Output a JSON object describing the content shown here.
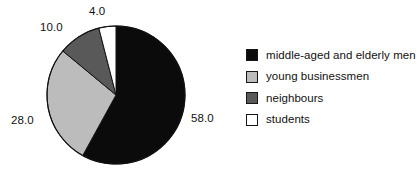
{
  "chart_data": {
    "type": "pie",
    "title": "",
    "categories": [
      "middle-aged and elderly men",
      "young businessmen",
      "neighbours",
      "students"
    ],
    "values": [
      58.0,
      28.0,
      10.0,
      4.0
    ],
    "value_labels": [
      "58.0",
      "28.0",
      "10.0",
      "4.0"
    ],
    "colors": [
      "#0b0b0b",
      "#bcbcbc",
      "#595959",
      "#ffffff"
    ],
    "total": 100.0,
    "start_angle_deg": 0,
    "direction": "clockwise",
    "legend_position": "right",
    "grid": false,
    "xlabel": "",
    "ylabel": ""
  },
  "legend": {
    "items": [
      {
        "label": "middle-aged and elderly men",
        "color": "#0b0b0b",
        "value": "58.0"
      },
      {
        "label": "young businessmen",
        "color": "#bcbcbc",
        "value": "28.0"
      },
      {
        "label": "neighbours",
        "color": "#595959",
        "value": "10.0"
      },
      {
        "label": "students",
        "color": "#ffffff",
        "value": "4.0"
      }
    ]
  },
  "pie_geometry": {
    "center_x": 116,
    "center_y": 95,
    "radius": 69,
    "outline_color": "#111111"
  }
}
